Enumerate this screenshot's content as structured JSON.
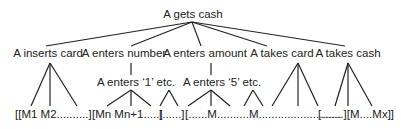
{
  "diagram": {
    "type": "tree",
    "root": {
      "label": "A gets cash"
    },
    "level1": [
      {
        "label": "A inserts card"
      },
      {
        "label": "A enters number"
      },
      {
        "label": "A enters amount"
      },
      {
        "label": "A takes card"
      },
      {
        "label": "A takes cash"
      }
    ],
    "level2": [
      {
        "label": "A enters ‘1’ etc.",
        "parent": "A enters number"
      },
      {
        "label": "A enters ‘5’ etc.",
        "parent": "A enters amount"
      }
    ],
    "leaves": [
      "[[M1  M2..........]",
      "[Mn Mn+1.....]",
      "[......]",
      "[......M..........M..........................",
      "[.......][M....Mx]]"
    ]
  }
}
